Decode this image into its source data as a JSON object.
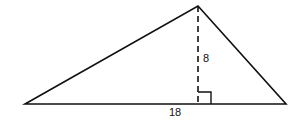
{
  "figure": {
    "type": "triangle",
    "height_label": "8",
    "base_label": "18",
    "stroke_color": "#111111",
    "has_right_angle_marker": true,
    "altitude_style": "dashed"
  }
}
